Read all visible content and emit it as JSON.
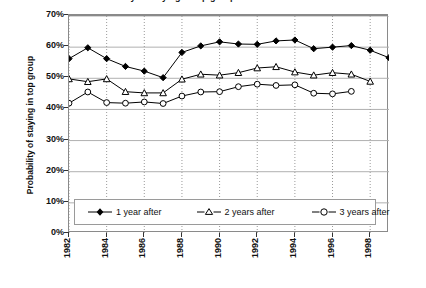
{
  "title_partial": "...ty of staying in top group...",
  "axes": {
    "ylabel": "Probability of staying in top group",
    "xlabel": "",
    "yticks": [
      "0%",
      "10%",
      "20%",
      "30%",
      "40%",
      "50%",
      "60%",
      "70%"
    ],
    "xticks": [
      "1982",
      "1984",
      "1986",
      "1988",
      "1990",
      "1992",
      "1994",
      "1996",
      "1998"
    ]
  },
  "legend": {
    "items": [
      {
        "label": "1 year after",
        "marker": "filled-diamond",
        "color": "#000000"
      },
      {
        "label": "2 years after",
        "marker": "open-triangle",
        "color": "#000000"
      },
      {
        "label": "3 years after",
        "marker": "open-circle",
        "color": "#000000"
      }
    ]
  },
  "chart_data": {
    "type": "line",
    "title": "Probability of staying in top group",
    "xlabel": "",
    "ylabel": "Probability of staying in top group",
    "xlim": [
      1982,
      1999
    ],
    "ylim": [
      0,
      70
    ],
    "ytick_values": [
      0,
      10,
      20,
      30,
      40,
      50,
      60,
      70
    ],
    "ytick_labels": [
      "0%",
      "10%",
      "20%",
      "30%",
      "40%",
      "50%",
      "60%",
      "70%"
    ],
    "xtick_values": [
      1982,
      1984,
      1986,
      1988,
      1990,
      1992,
      1994,
      1996,
      1998
    ],
    "grid": "horizontal solid gridlines and vertical dotted gridlines at even years",
    "legend_position": "inside-bottom-center",
    "units": "percent",
    "series": [
      {
        "name": "1 year after",
        "marker": "filled-diamond",
        "color": "#000000",
        "x": [
          1982,
          1983,
          1984,
          1985,
          1986,
          1987,
          1988,
          1989,
          1990,
          1991,
          1992,
          1993,
          1994,
          1995,
          1996,
          1997,
          1998,
          1999
        ],
        "values": [
          56.3,
          59.8,
          56.3,
          53.8,
          52.3,
          50.2,
          58.3,
          60.4,
          61.7,
          61.0,
          60.9,
          62.0,
          62.3,
          59.5,
          60.0,
          60.5,
          59.0,
          56.6
        ]
      },
      {
        "name": "2 years after",
        "marker": "open-triangle",
        "color": "#000000",
        "x": [
          1982,
          1983,
          1984,
          1985,
          1986,
          1987,
          1988,
          1989,
          1990,
          1991,
          1992,
          1993,
          1994,
          1995,
          1996,
          1997,
          1998
        ],
        "values": [
          49.8,
          48.9,
          49.8,
          45.7,
          45.3,
          45.3,
          49.7,
          51.3,
          51.0,
          51.8,
          53.3,
          53.7,
          52.0,
          51.0,
          51.8,
          51.3,
          49.0
        ]
      },
      {
        "name": "3 years after",
        "marker": "open-circle",
        "color": "#000000",
        "x": [
          1982,
          1983,
          1984,
          1985,
          1986,
          1987,
          1988,
          1989,
          1990,
          1991,
          1992,
          1993,
          1994,
          1995,
          1996,
          1997
        ],
        "values": [
          42.0,
          45.6,
          42.2,
          42.0,
          42.4,
          41.9,
          44.3,
          45.6,
          45.7,
          47.3,
          48.1,
          47.7,
          47.9,
          45.2,
          45.0,
          45.8
        ]
      }
    ]
  }
}
